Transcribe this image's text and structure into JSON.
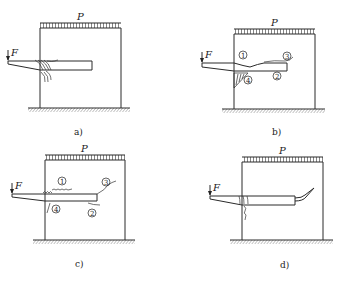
{
  "figure": {
    "load_label": "P",
    "force_label": "F",
    "panels": [
      {
        "id": "a",
        "caption": "a)",
        "markers": []
      },
      {
        "id": "b",
        "caption": "b)",
        "markers": [
          "1",
          "2",
          "3",
          "4"
        ]
      },
      {
        "id": "c",
        "caption": "c)",
        "markers": [
          "1",
          "2",
          "3",
          "4"
        ]
      },
      {
        "id": "d",
        "caption": "d)",
        "markers": []
      }
    ]
  },
  "markers": {
    "m1": "1",
    "m2": "2",
    "m3": "3",
    "m4": "4"
  }
}
